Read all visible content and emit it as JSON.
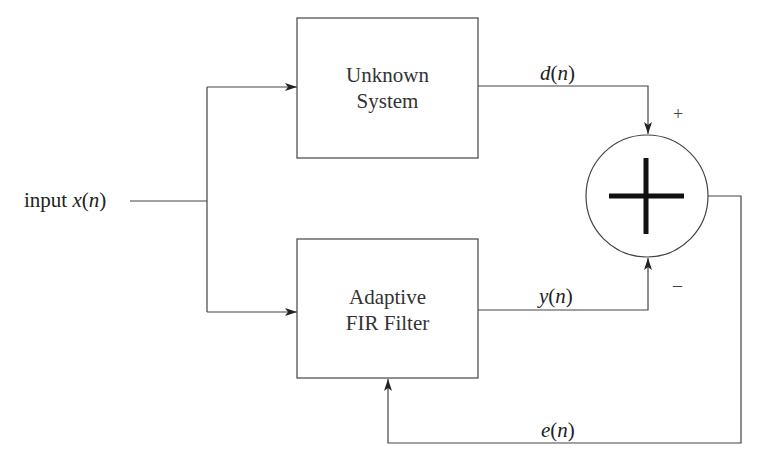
{
  "diagram": {
    "input": {
      "prefix": "input ",
      "signal": "x",
      "open": "(",
      "arg": "n",
      "close": ")"
    },
    "blocks": {
      "unknown_system": {
        "line1": "Unknown",
        "line2": "System"
      },
      "adaptive_filter": {
        "line1": "Adaptive",
        "line2": "FIR Filter"
      }
    },
    "signals": {
      "desired": {
        "signal": "d",
        "open": "(",
        "arg": "n",
        "close": ")"
      },
      "output": {
        "signal": "y",
        "open": "(",
        "arg": "n",
        "close": ")"
      },
      "error": {
        "signal": "e",
        "open": "(",
        "arg": "n",
        "close": ")"
      }
    },
    "summer": {
      "plus_sign": "+",
      "minus_sign": "–",
      "symbol": "sum-junction"
    },
    "colors": {
      "line": "#444444",
      "text": "#222222",
      "background": "#ffffff"
    }
  }
}
